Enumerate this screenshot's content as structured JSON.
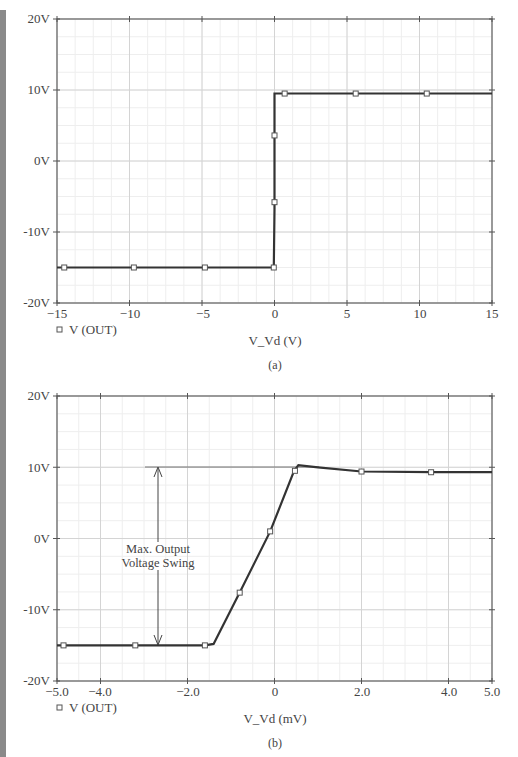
{
  "chart_data": [
    {
      "id": "a",
      "type": "line",
      "title": "",
      "caption": "(a)",
      "xlabel": "V_Vd (V)",
      "ylabel": "",
      "xlim": [
        -15,
        15
      ],
      "ylim": [
        -20,
        20
      ],
      "grid": true,
      "x_ticks": [
        "-15",
        "-10",
        "-5",
        "0",
        "5",
        "10",
        "15"
      ],
      "y_ticks": [
        "20V",
        "10V",
        "0V",
        "-10V",
        "-20V"
      ],
      "legend": [
        {
          "name": "V (OUT)",
          "marker": "square"
        }
      ],
      "legend_position": "bottom-left",
      "series": [
        {
          "name": "V (OUT)",
          "x": [
            -15,
            -14.5,
            -10,
            -5,
            -0.05,
            0,
            0,
            0,
            0.05,
            0.7,
            5.5,
            10.5,
            15
          ],
          "y": [
            -15,
            -15,
            -15,
            -15,
            -15,
            -6.8,
            3.5,
            9.5,
            9.5,
            9.5,
            9.5,
            9.5,
            9.5
          ],
          "markers_x": [
            -14.5,
            -9.7,
            -4.8,
            -0.05,
            0,
            0,
            0.7,
            5.6,
            10.5
          ],
          "markers_y": [
            -15,
            -15,
            -15,
            -15,
            -5.8,
            3.6,
            9.5,
            9.5,
            9.5
          ]
        }
      ]
    },
    {
      "id": "b",
      "type": "line",
      "title": "",
      "caption": "(b)",
      "xlabel": "V_Vd (mV)",
      "ylabel": "",
      "xlim": [
        -5,
        5
      ],
      "ylim": [
        -20,
        20
      ],
      "grid": true,
      "x_ticks": [
        "-5.0",
        "-4.0",
        "-2.0",
        "0",
        "2.0",
        "4.0",
        "5.0"
      ],
      "y_ticks": [
        "20V",
        "10V",
        "0V",
        "-10V",
        "-20V"
      ],
      "legend": [
        {
          "name": "V (OUT)",
          "marker": "square"
        }
      ],
      "legend_position": "bottom-left",
      "annotation": {
        "text_line1": "Max. Output",
        "text_line2": "Voltage Swing",
        "from_y": -15,
        "to_y": 10,
        "at_x": -2.65
      },
      "series": [
        {
          "name": "V (OUT)",
          "x": [
            -5,
            -3.2,
            -1.6,
            -1.4,
            -0.8,
            -0.1,
            0.45,
            0.55,
            1.0,
            2.0,
            3.6,
            5.0
          ],
          "y": [
            -15,
            -15,
            -15,
            -14.8,
            -7.6,
            1.0,
            9.5,
            10.3,
            10.0,
            9.4,
            9.3,
            9.3
          ],
          "markers_x": [
            -4.85,
            -3.2,
            -1.6,
            -0.8,
            -0.1,
            0.47,
            2.0,
            3.6
          ],
          "markers_y": [
            -15,
            -15,
            -15,
            -7.6,
            1.0,
            9.5,
            9.4,
            9.3
          ]
        }
      ]
    }
  ],
  "plot_a": {
    "y_labels": [
      "20V",
      "10V",
      "0V",
      "-10V",
      "-20V"
    ],
    "x_labels": [
      "−15",
      "−10",
      "−5",
      "0",
      "5",
      "10",
      "15"
    ],
    "legend_label": "V (OUT)",
    "xlabel": "V_Vd (V)",
    "caption": "(a)"
  },
  "plot_b": {
    "y_labels": [
      "20V",
      "10V",
      "0V",
      "-10V",
      "-20V"
    ],
    "x_labels": [
      "−5.0",
      "−4.0",
      "−2.0",
      "0",
      "2.0",
      "4.0",
      "5.0"
    ],
    "legend_label": "V (OUT)",
    "xlabel": "V_Vd (mV)",
    "caption": "(b)",
    "annotation_line1": "Max. Output",
    "annotation_line2": "Voltage Swing"
  }
}
